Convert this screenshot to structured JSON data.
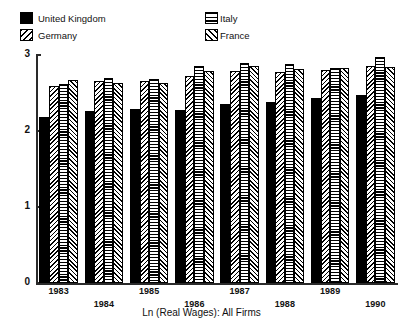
{
  "chart_data": {
    "type": "bar",
    "title": "ECONOMICS AND THE MARKET",
    "xlabel": "Ln (Real Wages): All Firms",
    "ylabel": "",
    "ylim": [
      0,
      3
    ],
    "yticks": [
      "0",
      "1",
      "2",
      "3"
    ],
    "grid": false,
    "legend_position": "top",
    "categories": [
      "1983",
      "1984",
      "1985",
      "1986",
      "1987",
      "1988",
      "1989",
      "1990"
    ],
    "series": [
      {
        "name": "United Kingdom",
        "pattern": "solid-black",
        "values": [
          2.18,
          2.26,
          2.29,
          2.28,
          2.35,
          2.38,
          2.44,
          2.47
        ]
      },
      {
        "name": "Germany",
        "pattern": "diagonal-hatch-backward",
        "values": [
          2.59,
          2.66,
          2.66,
          2.73,
          2.79,
          2.78,
          2.8,
          2.85
        ]
      },
      {
        "name": "Italy",
        "pattern": "horizontal-lines",
        "values": [
          2.62,
          2.7,
          2.68,
          2.86,
          2.9,
          2.88,
          2.83,
          2.98
        ]
      },
      {
        "name": "France",
        "pattern": "diagonal-hatch-forward",
        "values": [
          2.67,
          2.63,
          2.63,
          2.79,
          2.85,
          2.82,
          2.83,
          2.84
        ]
      }
    ]
  },
  "legend": {
    "items": [
      {
        "label": "United Kingdom",
        "fill": "fill-uk",
        "icon": "legend-swatch-solid"
      },
      {
        "label": "Germany",
        "fill": "fill-de",
        "icon": "legend-swatch-diagonal"
      },
      {
        "label": "Italy",
        "fill": "fill-it",
        "icon": "legend-swatch-horizontal"
      },
      {
        "label": "France",
        "fill": "fill-fr",
        "icon": "legend-swatch-hatch"
      }
    ]
  }
}
